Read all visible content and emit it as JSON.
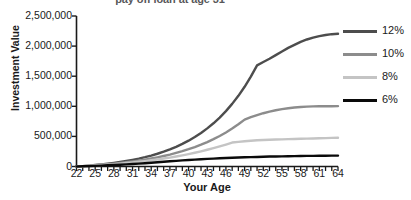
{
  "chart_data": {
    "type": "line",
    "title": "pay off loan at age 31",
    "xlabel": "Your Age",
    "ylabel": "Investment Value",
    "xlim": [
      22,
      64
    ],
    "ylim": [
      0,
      2500000
    ],
    "grid": false,
    "legend_position": "right",
    "x_tick_labels": [
      "22",
      "25",
      "28",
      "31",
      "34",
      "37",
      "40",
      "43",
      "46",
      "49",
      "52",
      "55",
      "58",
      "61",
      "64"
    ],
    "x_ticks": [
      22,
      25,
      28,
      31,
      34,
      37,
      40,
      43,
      46,
      49,
      52,
      55,
      58,
      61,
      64
    ],
    "x_minor_tick_step": 1,
    "y_tick_labels": [
      "0",
      "500,000",
      "1,000,000",
      "1,500,000",
      "2,000,000",
      "2,500,000"
    ],
    "y_ticks": [
      0,
      500000,
      1000000,
      1500000,
      2000000,
      2500000
    ],
    "x": [
      22,
      23,
      24,
      25,
      26,
      27,
      28,
      29,
      30,
      31,
      32,
      33,
      34,
      35,
      36,
      37,
      38,
      39,
      40,
      41,
      42,
      43,
      44,
      45,
      46,
      47,
      48,
      49,
      50,
      51,
      52,
      53,
      54,
      55,
      56,
      57,
      58,
      59,
      60,
      61,
      62,
      63,
      64
    ],
    "series": [
      {
        "name": "12%",
        "color": "#4d4d4d",
        "values": [
          0,
          7000,
          15000,
          24000,
          34000,
          46000,
          59000,
          74000,
          91000,
          110000,
          131000,
          155000,
          182000,
          212000,
          246000,
          284000,
          327000,
          375000,
          429000,
          489000,
          557000,
          633000,
          718000,
          813000,
          920000,
          1040000,
          1174000,
          1324000,
          1492000,
          1680000,
          1735000,
          1790000,
          1850000,
          1910000,
          1970000,
          2020000,
          2070000,
          2110000,
          2140000,
          2165000,
          2185000,
          2198000,
          2205000
        ]
      },
      {
        "name": "10%",
        "color": "#8c8c8c",
        "values": [
          0,
          6000,
          13000,
          20000,
          28000,
          37000,
          47000,
          58000,
          70000,
          83000,
          98000,
          114000,
          132000,
          152000,
          174000,
          198000,
          225000,
          254000,
          287000,
          323000,
          362000,
          406000,
          454000,
          507000,
          565000,
          630000,
          701000,
          779000,
          820000,
          855000,
          885000,
          912000,
          935000,
          953000,
          968000,
          980000,
          988000,
          994000,
          998000,
          1000000,
          1001000,
          1002000,
          1003000
        ]
      },
      {
        "name": "8%",
        "color": "#c4c4c4",
        "values": [
          0,
          5000,
          11000,
          17000,
          24000,
          31000,
          39000,
          48000,
          57000,
          67000,
          78000,
          90000,
          103000,
          117000,
          132000,
          148000,
          166000,
          185000,
          206000,
          228000,
          252000,
          278000,
          305000,
          334000,
          365000,
          398000,
          410000,
          420000,
          428000,
          435000,
          440000,
          444000,
          448000,
          451000,
          454000,
          457000,
          460000,
          463000,
          466000,
          469000,
          472000,
          475000,
          478000
        ]
      },
      {
        "name": "6%",
        "color": "#0a0a0a",
        "values": [
          0,
          3000,
          7000,
          11000,
          15000,
          20000,
          25000,
          30000,
          36000,
          42000,
          48000,
          55000,
          62000,
          70000,
          78000,
          86000,
          94000,
          101000,
          108000,
          114000,
          120000,
          126000,
          131000,
          136000,
          141000,
          145000,
          149000,
          153000,
          156000,
          159000,
          162000,
          165000,
          167000,
          169000,
          171000,
          173000,
          175000,
          176000,
          177000,
          178000,
          179000,
          180000,
          181000
        ]
      }
    ]
  },
  "legend": {
    "items": [
      {
        "label": "12%",
        "color": "#4d4d4d"
      },
      {
        "label": "10%",
        "color": "#8c8c8c"
      },
      {
        "label": "8%",
        "color": "#c4c4c4"
      },
      {
        "label": "6%",
        "color": "#0a0a0a"
      }
    ]
  },
  "colors": {
    "axis": "#1a1a1a",
    "title_text": "#58585a",
    "label_text": "#1a1a1a",
    "background": "#ffffff"
  }
}
